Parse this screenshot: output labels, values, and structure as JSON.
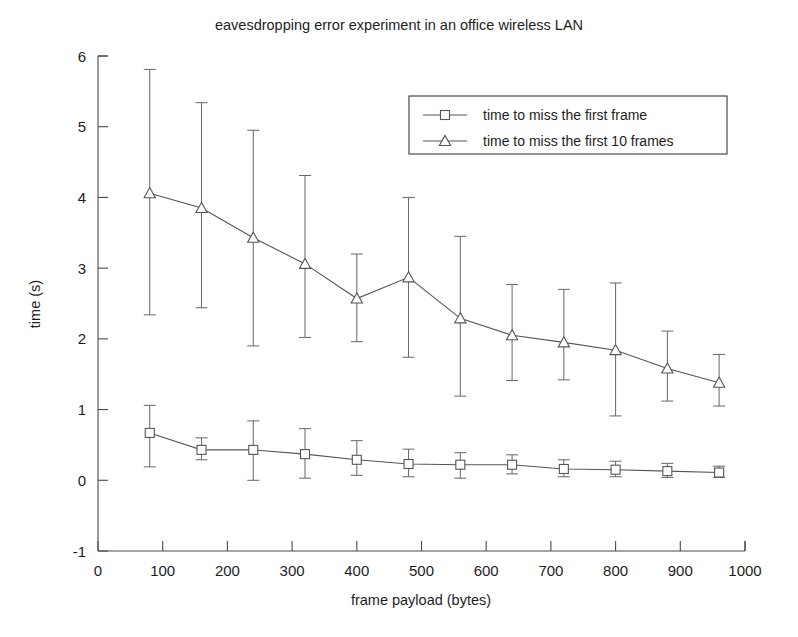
{
  "chart_data": {
    "type": "line",
    "title": "eavesdropping error experiment in an office wireless LAN",
    "xlabel": "frame payload (bytes)",
    "ylabel": "time (s)",
    "xlim": [
      0,
      1000
    ],
    "ylim": [
      -1,
      6
    ],
    "xticks": [
      0,
      100,
      200,
      300,
      400,
      500,
      600,
      700,
      800,
      900,
      1000
    ],
    "yticks": [
      -1,
      0,
      1,
      2,
      3,
      4,
      5,
      6
    ],
    "grid": false,
    "legend_position": "top-right-inside",
    "x": [
      80,
      160,
      240,
      320,
      400,
      480,
      560,
      640,
      720,
      800,
      880,
      960
    ],
    "series": [
      {
        "name": "time to miss the first frame",
        "marker": "square",
        "values": [
          0.67,
          0.43,
          0.43,
          0.37,
          0.29,
          0.23,
          0.22,
          0.22,
          0.16,
          0.15,
          0.13,
          0.11
        ],
        "err_upper": [
          1.06,
          0.6,
          0.84,
          0.73,
          0.56,
          0.44,
          0.39,
          0.36,
          0.29,
          0.27,
          0.24,
          0.2
        ],
        "err_lower": [
          0.19,
          0.29,
          0.0,
          0.03,
          0.07,
          0.05,
          0.03,
          0.09,
          0.05,
          0.05,
          0.04,
          0.04
        ]
      },
      {
        "name": "time to miss the first 10 frames",
        "marker": "triangle",
        "values": [
          4.06,
          3.85,
          3.43,
          3.06,
          2.57,
          2.87,
          2.29,
          2.05,
          1.95,
          1.84,
          1.58,
          1.38
        ],
        "err_upper": [
          5.81,
          5.34,
          4.95,
          4.31,
          3.2,
          4.0,
          3.45,
          2.77,
          2.7,
          2.79,
          2.11,
          1.78
        ],
        "err_lower": [
          2.34,
          2.44,
          1.9,
          2.02,
          1.96,
          1.74,
          1.19,
          1.41,
          1.42,
          0.91,
          1.12,
          1.05
        ]
      }
    ]
  },
  "legend": {
    "entries": [
      {
        "label": "time to miss the first frame",
        "marker": "square-marker"
      },
      {
        "label": "time to miss the first 10 frames",
        "marker": "triangle-marker"
      }
    ]
  },
  "colors": {
    "axis": "#4a4a4a",
    "series_line": "#555555",
    "background": "#ffffff",
    "text": "#1d1d1d"
  }
}
